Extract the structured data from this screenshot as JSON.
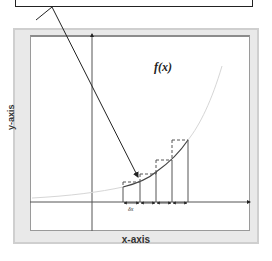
{
  "diagram": {
    "function_label": "f(x)",
    "x_axis_label": "x-axis",
    "y_axis_label": "y-axis",
    "delta_label": "δx",
    "rectangle_count": 4,
    "rectangles_x": [
      123,
      140,
      156,
      172,
      188
    ],
    "colors": {
      "frame_background": "#e9e9e9",
      "frame_border": "#cfcfcf",
      "plot_background": "#ffffff",
      "axis": "#333333",
      "curve": "#444444",
      "curve_faded": "#d8d8d8",
      "dashed": "#555555"
    }
  },
  "callout": {
    "text": ""
  }
}
